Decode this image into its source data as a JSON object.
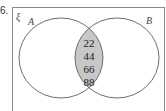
{
  "question_number": "6.",
  "venn": {
    "universal_label": "ξ",
    "set_a_label": "A",
    "set_b_label": "B",
    "intersection_values": [
      "22",
      "44",
      "66",
      "88"
    ],
    "colors": {
      "intersection_fill": "#c8c8c8",
      "outline": "#6e6e6e",
      "frame": "#8a8a8a"
    }
  }
}
